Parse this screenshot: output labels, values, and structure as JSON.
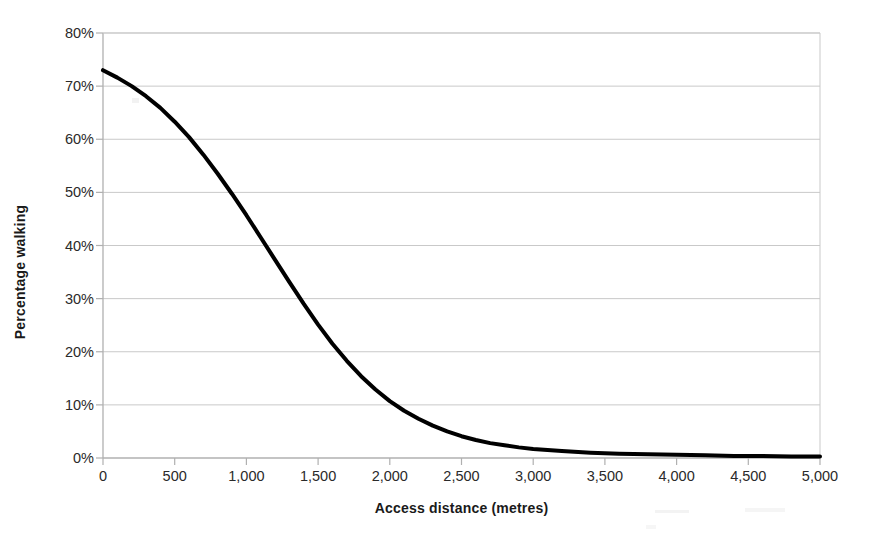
{
  "chart_data": {
    "type": "line",
    "title": "",
    "subtitle": "",
    "xlabel": "Access distance (metres)",
    "ylabel": "Percentage walking",
    "xlim": [
      0,
      5000
    ],
    "ylim": [
      0,
      0.8
    ],
    "grid": "horizontal",
    "legend": "none",
    "line_color": "#000000",
    "line_width": 4,
    "grid_color": "#c9c9c9",
    "axis_color": "#b0b0b0",
    "x_tick_labels": [
      "0",
      "500",
      "1,000",
      "1,500",
      "2,000",
      "2,500",
      "3,000",
      "3,500",
      "4,000",
      "4,500",
      "5,000"
    ],
    "x_tick_values": [
      0,
      500,
      1000,
      1500,
      2000,
      2500,
      3000,
      3500,
      4000,
      4500,
      5000
    ],
    "y_tick_labels": [
      "0%",
      "10%",
      "20%",
      "30%",
      "40%",
      "50%",
      "60%",
      "70%",
      "80%"
    ],
    "y_tick_values": [
      0,
      0.1,
      0.2,
      0.3,
      0.4,
      0.5,
      0.6,
      0.7,
      0.8
    ],
    "series": [
      {
        "name": "Percentage walking",
        "x": [
          0,
          100,
          200,
          300,
          400,
          500,
          600,
          700,
          800,
          900,
          1000,
          1100,
          1200,
          1300,
          1400,
          1500,
          1600,
          1700,
          1800,
          1900,
          2000,
          2100,
          2200,
          2300,
          2400,
          2500,
          2600,
          2700,
          2800,
          2900,
          3000,
          3200,
          3400,
          3600,
          3800,
          4000,
          4200,
          4400,
          4600,
          4800,
          5000
        ],
        "y": [
          0.73,
          0.716,
          0.7,
          0.681,
          0.659,
          0.633,
          0.604,
          0.571,
          0.535,
          0.497,
          0.457,
          0.415,
          0.373,
          0.331,
          0.29,
          0.251,
          0.215,
          0.183,
          0.154,
          0.129,
          0.107,
          0.089,
          0.074,
          0.061,
          0.05,
          0.041,
          0.034,
          0.028,
          0.024,
          0.02,
          0.017,
          0.013,
          0.01,
          0.008,
          0.007,
          0.006,
          0.005,
          0.004,
          0.004,
          0.003,
          0.003
        ]
      }
    ]
  },
  "axes": {
    "x_title": "Access distance (metres)",
    "y_title": "Percentage walking"
  }
}
